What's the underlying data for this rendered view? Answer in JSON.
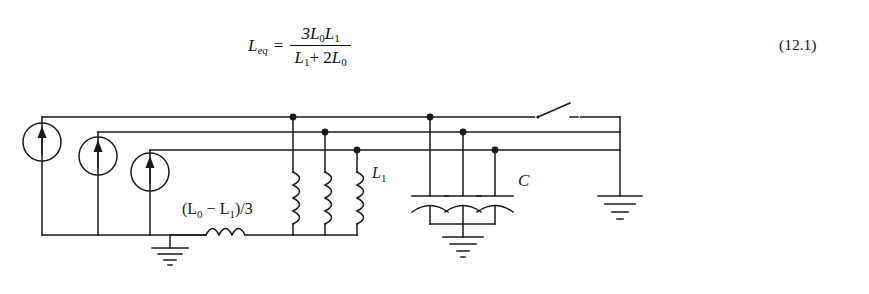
{
  "equation": {
    "lhs": "L",
    "lhs_sub": "eq",
    "relation": "=",
    "numerator": "3L",
    "numerator_sub0": "0",
    "numerator_var2": "L",
    "numerator_sub1": "1",
    "denominator_var1": "L",
    "denominator_sub1": "1",
    "denominator_plus": "+ 2",
    "denominator_var2": "L",
    "denominator_sub0": "0",
    "number": "(12.1)",
    "plain_text": "L_eq = 3L0L1 / (L1 + 2L0)"
  },
  "circuit": {
    "title": "Three-phase equivalent circuit with current sources, inductors and capacitors",
    "labels": {
      "series_inductor": "(L",
      "series_inductor_sub0": "0",
      "series_inductor_minus": " − L",
      "series_inductor_sub1": "1",
      "series_inductor_tail": ")/3",
      "series_inductor_full": "(L0 − L1)/3",
      "shunt_inductor": "L",
      "shunt_inductor_sub": "1",
      "capacitor": "C"
    },
    "components": {
      "current_sources": [
        {
          "name": "current-source-a",
          "cx": 42,
          "cy": 46,
          "r": 19,
          "bus_y": 21,
          "bottom_y": 139
        },
        {
          "name": "current-source-b",
          "cx": 98,
          "cy": 60,
          "r": 19,
          "bus_y": 36,
          "bottom_y": 139
        },
        {
          "name": "current-source-c",
          "cx": 150,
          "cy": 76,
          "r": 19,
          "bus_y": 54,
          "bottom_y": 139
        }
      ],
      "bus_lines": [
        {
          "name": "bus-line-a",
          "y": 21,
          "x1": 42,
          "x2": 620
        },
        {
          "name": "bus-line-b",
          "y": 36,
          "x1": 98,
          "x2": 620
        },
        {
          "name": "bus-line-c",
          "y": 54,
          "x1": 150,
          "x2": 620
        }
      ],
      "shunt_inductors": [
        {
          "name": "shunt-inductor-a",
          "x": 293,
          "top": 21,
          "coils": 4
        },
        {
          "name": "shunt-inductor-b",
          "x": 325,
          "top": 36,
          "coils": 4
        },
        {
          "name": "shunt-inductor-c",
          "x": 357,
          "top": 54,
          "coils": 4
        }
      ],
      "capacitors": [
        {
          "name": "capacitor-a",
          "x": 430,
          "top": 21
        },
        {
          "name": "capacitor-b",
          "x": 463,
          "top": 36
        },
        {
          "name": "capacitor-c",
          "x": 495,
          "top": 54
        }
      ],
      "series_inductor": {
        "name": "series-inductor",
        "x1": 206,
        "x2": 258,
        "y": 142,
        "coils": 3
      },
      "switch": {
        "name": "open-switch",
        "x1": 540,
        "x2": 580,
        "y": 21,
        "state": "open"
      },
      "grounds": [
        {
          "name": "ground-source-neutral",
          "x": 170,
          "y": 139
        },
        {
          "name": "ground-capacitor-neutral",
          "x": 463,
          "y": 186
        },
        {
          "name": "ground-system-neutral",
          "x": 620,
          "y": 100
        }
      ]
    },
    "colors": {
      "line": "#1a1a1a",
      "background": "#ffffff"
    }
  }
}
